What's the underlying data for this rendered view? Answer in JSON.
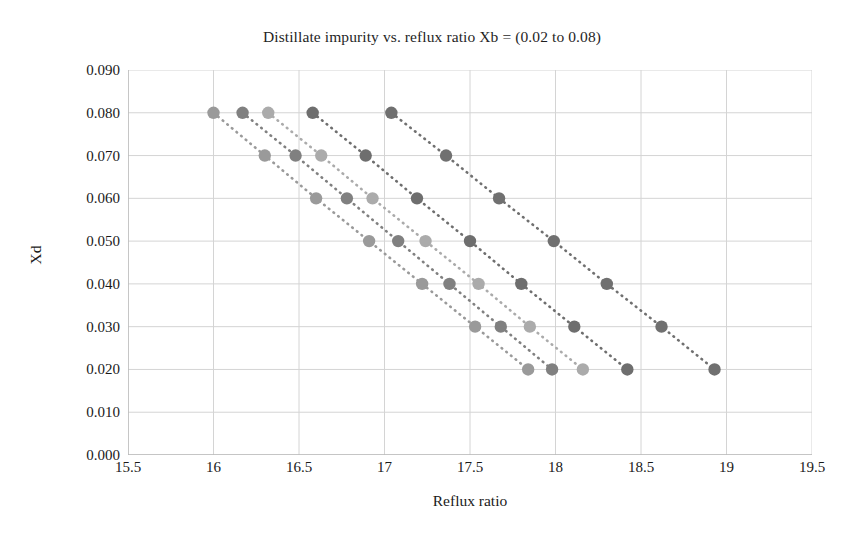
{
  "chart_data": {
    "type": "scatter",
    "title": "Distillate impurity vs. reflux ratio Xb = (0.02 to 0.08)",
    "xlabel": "Reflux ratio",
    "ylabel": "Xd",
    "xlim": [
      15.5,
      19.5
    ],
    "ylim": [
      0.0,
      0.09
    ],
    "xticks": [
      "15.5",
      "16",
      "16.5",
      "17",
      "17.5",
      "18",
      "18.5",
      "19",
      "19.5"
    ],
    "xtick_values": [
      15.5,
      16,
      16.5,
      17,
      17.5,
      18,
      18.5,
      19,
      19.5
    ],
    "yticks": [
      "0.000",
      "0.010",
      "0.020",
      "0.030",
      "0.040",
      "0.050",
      "0.060",
      "0.070",
      "0.080",
      "0.090"
    ],
    "ytick_values": [
      0.0,
      0.01,
      0.02,
      0.03,
      0.04,
      0.05,
      0.06,
      0.07,
      0.08,
      0.09
    ],
    "grid": true,
    "legend": "none",
    "marker": "circle",
    "linestyle": "dotted",
    "series": [
      {
        "name": "Xb = 0.02",
        "color": "#9a9a9a",
        "x": [
          16.0,
          16.3,
          16.6,
          16.91,
          17.22,
          17.53,
          17.84
        ],
        "y": [
          0.08,
          0.07,
          0.06,
          0.05,
          0.04,
          0.03,
          0.02
        ]
      },
      {
        "name": "Xb = 0.035",
        "color": "#808080",
        "x": [
          16.17,
          16.48,
          16.78,
          17.08,
          17.38,
          17.68,
          17.98
        ],
        "y": [
          0.08,
          0.07,
          0.06,
          0.05,
          0.04,
          0.03,
          0.02
        ]
      },
      {
        "name": "Xb = 0.05",
        "color": "#ababab",
        "x": [
          16.32,
          16.63,
          16.93,
          17.24,
          17.55,
          17.85,
          18.16
        ],
        "y": [
          0.08,
          0.07,
          0.06,
          0.05,
          0.04,
          0.03,
          0.02
        ]
      },
      {
        "name": "Xb = 0.065",
        "color": "#6e6e6e",
        "x": [
          16.58,
          16.89,
          17.19,
          17.5,
          17.8,
          18.11,
          18.42
        ],
        "y": [
          0.08,
          0.07,
          0.06,
          0.05,
          0.04,
          0.03,
          0.02
        ]
      },
      {
        "name": "Xb = 0.08",
        "color": "#707070",
        "x": [
          17.04,
          17.36,
          17.67,
          17.99,
          18.3,
          18.62,
          18.93
        ],
        "y": [
          0.08,
          0.07,
          0.06,
          0.05,
          0.04,
          0.03,
          0.02
        ]
      }
    ]
  },
  "style": {
    "background": "#ffffff",
    "grid_color": "#d4d4d4",
    "axis_color": "#b8b8b8",
    "text_color": "#1a1a1a"
  }
}
